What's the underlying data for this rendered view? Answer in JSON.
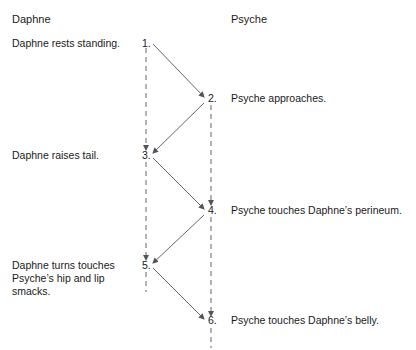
{
  "columns": {
    "left_header": "Daphne",
    "right_header": "Psyche"
  },
  "steps": [
    {
      "num": "1.",
      "actor": "Daphne",
      "text": "Daphne rests standing."
    },
    {
      "num": "2.",
      "actor": "Psyche",
      "text": "Psyche approaches."
    },
    {
      "num": "3.",
      "actor": "Daphne",
      "text": "Daphne raises tail."
    },
    {
      "num": "4.",
      "actor": "Psyche",
      "text": "Psyche touches Daphne’s perineum."
    },
    {
      "num": "5.",
      "actor": "Daphne",
      "text_lines": [
        "Daphne turns touches",
        "Psyche’s hip and lip",
        "smacks."
      ]
    },
    {
      "num": "6.",
      "actor": "Psyche",
      "text": "Psyche touches Daphne’s belly."
    }
  ],
  "colors": {
    "text": "#1a1a1a",
    "line": "#555555"
  }
}
